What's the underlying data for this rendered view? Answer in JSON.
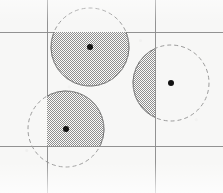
{
  "figure": {
    "width": 223,
    "height": 193,
    "background_color": "#f7f7f6"
  },
  "colors": {
    "background": "#f7f7f6",
    "gridline": "#8d8d8d",
    "circle_outline": "#9b9b9b",
    "hatch_dark": "#8e8e8e",
    "hatch_light": "#fbfbfa",
    "center_dot": "#111111",
    "clipped_edge": "#6f6f6f"
  },
  "grid": {
    "label": "rectangular partition grid",
    "stroke_width": 1,
    "vertical_lines": [
      {
        "name": "grid-line-vertical-left",
        "x": 47,
        "y1": 0,
        "y2": 193
      },
      {
        "name": "grid-line-vertical-right",
        "x": 155,
        "y1": 0,
        "y2": 193
      }
    ],
    "horizontal_lines": [
      {
        "name": "grid-line-horizontal-top",
        "y": 32,
        "x1": 0,
        "x2": 223
      },
      {
        "name": "grid-line-horizontal-bottom",
        "y": 146,
        "x1": 0,
        "x2": 223
      }
    ]
  },
  "circles": [
    {
      "id": "circle-top",
      "label": "top circle",
      "cx": 90,
      "cy": 47,
      "r": 39,
      "outline_style": "dashed",
      "dash_pattern": "4 3",
      "fill_pattern": "checker-hatch",
      "center_dot_radius": 3,
      "clip_region": {
        "x": 47,
        "y": 32,
        "width": 108,
        "height": 114
      },
      "clip_description": "filled only below the top horizontal gridline, between the two vertical gridlines"
    },
    {
      "id": "circle-bottom-left",
      "label": "bottom left circle",
      "cx": 66,
      "cy": 129,
      "r": 38,
      "outline_style": "dashed",
      "dash_pattern": "4 3",
      "fill_pattern": "checker-hatch",
      "center_dot_radius": 3,
      "clip_region": {
        "x": 47,
        "y": 32,
        "width": 108,
        "height": 114
      },
      "clip_description": "filled only right of the left vertical gridline and above the bottom horizontal gridline"
    },
    {
      "id": "circle-right",
      "label": "right circle",
      "cx": 171,
      "cy": 83,
      "r": 38,
      "outline_style": "dashed",
      "dash_pattern": "4 3",
      "fill_pattern": "checker-hatch",
      "center_dot_radius": 3,
      "clip_region": {
        "x": 47,
        "y": 32,
        "width": 108,
        "height": 114
      },
      "clip_description": "filled only left of the right vertical gridline"
    }
  ]
}
